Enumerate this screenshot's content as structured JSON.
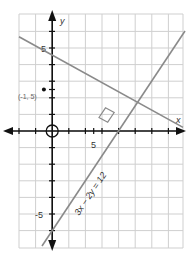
{
  "diagram": {
    "type": "coordinate-graph",
    "axes": {
      "x_label": "x",
      "y_label": "y",
      "x_tick_label": "5",
      "y_tick_label_pos": "5",
      "y_tick_label_neg": "-5",
      "x_range": [
        -7,
        16
      ],
      "y_range": [
        -14,
        14
      ],
      "grid_spacing": 2
    },
    "point": {
      "label": "(-1, 5)",
      "x": -1,
      "y": 5
    },
    "lines": [
      {
        "name": "given-line",
        "equation_label": "3x − 2y = 12",
        "slope": 1.5,
        "intercept": -6
      },
      {
        "name": "perpendicular-line",
        "equation_label": "",
        "slope": -0.6667,
        "through": [
          -1,
          5
        ]
      }
    ],
    "right_angle_marker": true,
    "origin_marker": "circle",
    "colors": {
      "grid": "#cfcfcf",
      "axis": "#111111",
      "line": "#8a8a8a"
    }
  }
}
